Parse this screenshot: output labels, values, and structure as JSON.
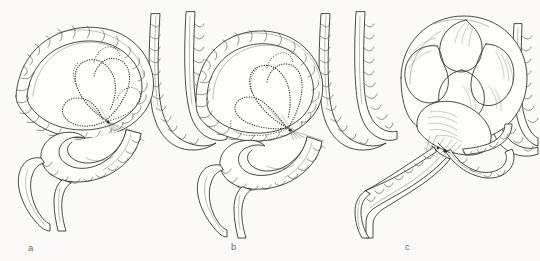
{
  "figure": {
    "kind": "anatomical-line-illustration",
    "background_color": "#fbfaf8",
    "ink_color": "#2b2b2b",
    "stipple_color": "#3a3a3a",
    "label_color": "#6b6b6b",
    "panel_count": 3
  },
  "panels": [
    {
      "id": "a",
      "label": "a",
      "description": "Redundant sigmoid loop with mesentery shown by dotted outline; early twist at the base",
      "distension": "none",
      "twist_turns": "partial"
    },
    {
      "id": "b",
      "label": "b",
      "description": "Sigmoid loop rotated about its mesenteric axis; mesenteric outline narrowed at the base",
      "distension": "mild",
      "twist_turns": "one"
    },
    {
      "id": "c",
      "label": "c",
      "description": "Massively distended closed loop with complete torsion at the narrowed base",
      "distension": "massive",
      "twist_turns": "complete"
    }
  ],
  "caption_fragment": {
    "text": "",
    "visible": false
  }
}
